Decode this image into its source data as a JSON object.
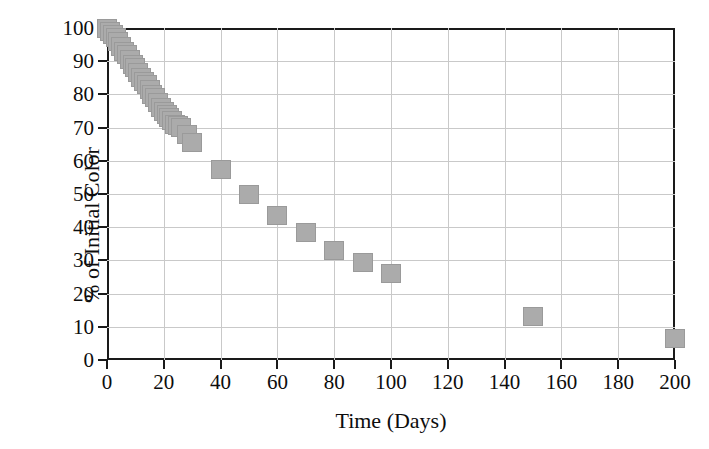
{
  "chart_data": {
    "type": "scatter",
    "title": "",
    "xlabel": "Time (Days)",
    "ylabel": "% of Initial Color",
    "xlim": [
      0,
      200
    ],
    "ylim": [
      0,
      100
    ],
    "xticks": [
      0,
      20,
      40,
      60,
      80,
      100,
      120,
      140,
      160,
      180,
      200
    ],
    "yticks": [
      0,
      10,
      20,
      30,
      40,
      50,
      60,
      70,
      80,
      90,
      100
    ],
    "xtick_labels": [
      "0",
      "20",
      "40",
      "60",
      "80",
      "100",
      "120",
      "140",
      "160",
      "180",
      "200"
    ],
    "ytick_labels": [
      "0",
      "10",
      "20",
      "30",
      "40",
      "50",
      "60",
      "70",
      "80",
      "90",
      "100"
    ],
    "grid": true,
    "legend": null,
    "marker_style": "filled-square",
    "marker_color": "#ababab",
    "series": [
      {
        "name": "Color retention",
        "x": [
          0,
          1,
          2,
          3,
          4,
          5,
          6,
          7,
          8,
          9,
          10,
          11,
          12,
          13,
          14,
          15,
          16,
          17,
          18,
          19,
          20,
          21,
          22,
          23,
          24,
          25,
          26,
          28,
          30,
          40,
          50,
          60,
          70,
          80,
          90,
          100,
          150,
          200
        ],
        "y": [
          100,
          99,
          98,
          97,
          96,
          94.5,
          93,
          92,
          90.5,
          89,
          88,
          86.5,
          85,
          84,
          83,
          81.5,
          80,
          79,
          77.5,
          76,
          75,
          74,
          73,
          72,
          71,
          70.5,
          70,
          68,
          65.5,
          57.5,
          50,
          43.5,
          38.5,
          33,
          29.5,
          26,
          13,
          6.5
        ]
      }
    ]
  }
}
